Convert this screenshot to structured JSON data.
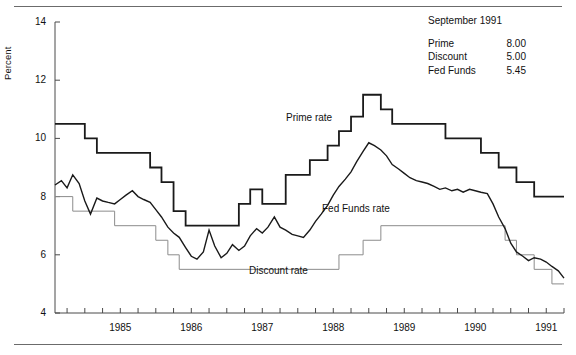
{
  "chart_data": {
    "type": "line",
    "title": "",
    "subtitle": "",
    "xlabel": "",
    "ylabel": "Percent",
    "ylim": [
      4,
      14
    ],
    "xlim": [
      1984.58,
      1991.75
    ],
    "yticks": [
      4,
      6,
      8,
      10,
      12,
      14
    ],
    "xticks": [
      1985,
      1986,
      1987,
      1988,
      1989,
      1990,
      1991
    ],
    "xtick_labels": [
      "1985",
      "1986",
      "1987",
      "1988",
      "1989",
      "1990",
      "1991"
    ],
    "ytick_labels": [
      "4",
      "6",
      "8",
      "10",
      "12",
      "14"
    ],
    "grid": false,
    "legend_position": "inline-annotations",
    "minor_tick_interval_years": 0.25,
    "series": [
      {
        "name": "Prime rate",
        "style": "step",
        "color": "#1a1a1a",
        "line_width": 1.8,
        "label_text": "Prime rate",
        "points": [
          [
            1984.58,
            10.5
          ],
          [
            1985.0,
            10.5
          ],
          [
            1985.0,
            10.0
          ],
          [
            1985.17,
            10.0
          ],
          [
            1985.17,
            9.5
          ],
          [
            1985.92,
            9.5
          ],
          [
            1985.92,
            9.0
          ],
          [
            1986.08,
            9.0
          ],
          [
            1986.08,
            8.5
          ],
          [
            1986.25,
            8.5
          ],
          [
            1986.25,
            7.5
          ],
          [
            1986.42,
            7.5
          ],
          [
            1986.42,
            7.0
          ],
          [
            1987.17,
            7.0
          ],
          [
            1987.17,
            7.75
          ],
          [
            1987.33,
            7.75
          ],
          [
            1987.33,
            8.25
          ],
          [
            1987.5,
            8.25
          ],
          [
            1987.5,
            7.75
          ],
          [
            1987.83,
            7.75
          ],
          [
            1987.83,
            8.75
          ],
          [
            1988.17,
            8.75
          ],
          [
            1988.17,
            9.25
          ],
          [
            1988.42,
            9.25
          ],
          [
            1988.42,
            9.75
          ],
          [
            1988.58,
            9.75
          ],
          [
            1988.58,
            10.25
          ],
          [
            1988.75,
            10.25
          ],
          [
            1988.75,
            10.75
          ],
          [
            1988.92,
            10.75
          ],
          [
            1988.92,
            11.5
          ],
          [
            1989.17,
            11.5
          ],
          [
            1989.17,
            11.0
          ],
          [
            1989.33,
            11.0
          ],
          [
            1989.33,
            10.5
          ],
          [
            1990.08,
            10.5
          ],
          [
            1990.08,
            10.0
          ],
          [
            1990.58,
            10.0
          ],
          [
            1990.58,
            9.5
          ],
          [
            1990.83,
            9.5
          ],
          [
            1990.83,
            9.0
          ],
          [
            1991.08,
            9.0
          ],
          [
            1991.08,
            8.5
          ],
          [
            1991.33,
            8.5
          ],
          [
            1991.33,
            8.0
          ],
          [
            1991.75,
            8.0
          ]
        ]
      },
      {
        "name": "Discount rate",
        "style": "step",
        "color": "#8c8c8c",
        "line_width": 1.0,
        "label_text": "Discount rate",
        "points": [
          [
            1984.58,
            8.0
          ],
          [
            1984.83,
            8.0
          ],
          [
            1984.83,
            7.5
          ],
          [
            1985.42,
            7.5
          ],
          [
            1985.42,
            7.0
          ],
          [
            1986.0,
            7.0
          ],
          [
            1986.0,
            6.5
          ],
          [
            1986.17,
            6.5
          ],
          [
            1986.17,
            6.0
          ],
          [
            1986.33,
            6.0
          ],
          [
            1986.33,
            5.5
          ],
          [
            1988.58,
            5.5
          ],
          [
            1988.58,
            6.0
          ],
          [
            1988.92,
            6.0
          ],
          [
            1988.92,
            6.5
          ],
          [
            1989.17,
            6.5
          ],
          [
            1989.17,
            7.0
          ],
          [
            1990.92,
            7.0
          ],
          [
            1990.92,
            6.5
          ],
          [
            1991.08,
            6.5
          ],
          [
            1991.08,
            6.0
          ],
          [
            1991.33,
            6.0
          ],
          [
            1991.33,
            5.5
          ],
          [
            1991.58,
            5.5
          ],
          [
            1991.58,
            5.0
          ],
          [
            1991.75,
            5.0
          ]
        ]
      },
      {
        "name": "Fed Funds rate",
        "style": "line",
        "color": "#1a1a1a",
        "line_width": 1.4,
        "label_text": "Fed Funds rate",
        "points": [
          [
            1984.58,
            8.4
          ],
          [
            1984.67,
            8.55
          ],
          [
            1984.75,
            8.3
          ],
          [
            1984.83,
            8.75
          ],
          [
            1984.92,
            8.45
          ],
          [
            1985.0,
            7.85
          ],
          [
            1985.08,
            7.4
          ],
          [
            1985.17,
            7.95
          ],
          [
            1985.25,
            7.85
          ],
          [
            1985.33,
            7.8
          ],
          [
            1985.42,
            7.75
          ],
          [
            1985.5,
            7.9
          ],
          [
            1985.58,
            8.05
          ],
          [
            1985.67,
            8.2
          ],
          [
            1985.75,
            8.0
          ],
          [
            1985.83,
            7.9
          ],
          [
            1985.92,
            7.8
          ],
          [
            1986.0,
            7.55
          ],
          [
            1986.08,
            7.3
          ],
          [
            1986.17,
            6.95
          ],
          [
            1986.25,
            6.75
          ],
          [
            1986.33,
            6.6
          ],
          [
            1986.42,
            6.25
          ],
          [
            1986.5,
            5.95
          ],
          [
            1986.58,
            5.85
          ],
          [
            1986.67,
            6.1
          ],
          [
            1986.75,
            6.85
          ],
          [
            1986.83,
            6.3
          ],
          [
            1986.92,
            5.9
          ],
          [
            1987.0,
            6.05
          ],
          [
            1987.08,
            6.35
          ],
          [
            1987.17,
            6.15
          ],
          [
            1987.25,
            6.3
          ],
          [
            1987.33,
            6.65
          ],
          [
            1987.42,
            6.9
          ],
          [
            1987.5,
            6.75
          ],
          [
            1987.58,
            6.95
          ],
          [
            1987.67,
            7.3
          ],
          [
            1987.75,
            6.95
          ],
          [
            1987.83,
            6.85
          ],
          [
            1987.92,
            6.7
          ],
          [
            1988.0,
            6.65
          ],
          [
            1988.08,
            6.6
          ],
          [
            1988.17,
            6.85
          ],
          [
            1988.25,
            7.15
          ],
          [
            1988.33,
            7.4
          ],
          [
            1988.42,
            7.7
          ],
          [
            1988.5,
            8.05
          ],
          [
            1988.58,
            8.35
          ],
          [
            1988.67,
            8.6
          ],
          [
            1988.75,
            8.85
          ],
          [
            1988.83,
            9.2
          ],
          [
            1988.92,
            9.55
          ],
          [
            1989.0,
            9.85
          ],
          [
            1989.08,
            9.75
          ],
          [
            1989.17,
            9.6
          ],
          [
            1989.25,
            9.4
          ],
          [
            1989.33,
            9.1
          ],
          [
            1989.42,
            8.95
          ],
          [
            1989.5,
            8.8
          ],
          [
            1989.58,
            8.65
          ],
          [
            1989.67,
            8.55
          ],
          [
            1989.75,
            8.5
          ],
          [
            1989.83,
            8.45
          ],
          [
            1989.92,
            8.35
          ],
          [
            1990.0,
            8.25
          ],
          [
            1990.08,
            8.3
          ],
          [
            1990.17,
            8.2
          ],
          [
            1990.25,
            8.25
          ],
          [
            1990.33,
            8.15
          ],
          [
            1990.42,
            8.25
          ],
          [
            1990.5,
            8.2
          ],
          [
            1990.58,
            8.15
          ],
          [
            1990.67,
            8.1
          ],
          [
            1990.75,
            7.75
          ],
          [
            1990.83,
            7.3
          ],
          [
            1990.92,
            6.9
          ],
          [
            1991.0,
            6.4
          ],
          [
            1991.08,
            6.1
          ],
          [
            1991.17,
            5.95
          ],
          [
            1991.25,
            5.8
          ],
          [
            1991.33,
            5.9
          ],
          [
            1991.42,
            5.85
          ],
          [
            1991.5,
            5.75
          ],
          [
            1991.58,
            5.6
          ],
          [
            1991.67,
            5.45
          ],
          [
            1991.75,
            5.2
          ]
        ]
      }
    ]
  },
  "annotation": {
    "date": "September 1991",
    "rows": [
      {
        "name": "Prime",
        "value": "8.00"
      },
      {
        "name": "Discount",
        "value": "5.00"
      },
      {
        "name": "Fed Funds",
        "value": "5.45"
      }
    ]
  }
}
